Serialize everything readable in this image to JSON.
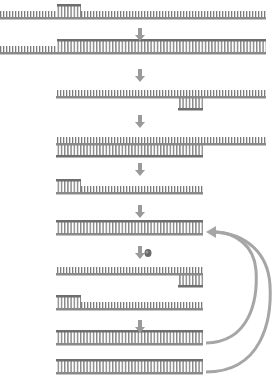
{
  "diagram": {
    "type": "dna-amplification-process",
    "colors": {
      "backbone": "#8a8a8a",
      "backbone_dark": "#6e6e6e",
      "rungs": "#7a7a7a",
      "arrow": "#9a9a9a",
      "enzyme": "#6a6a6a",
      "background": "#ffffff"
    },
    "rows": [
      {
        "id": 1,
        "y": 17,
        "x1": 0,
        "x2": 266,
        "double": [
          [
            57,
            81
          ]
        ],
        "top_strand": [
          [
            57,
            81
          ]
        ]
      },
      {
        "id": 2,
        "y": 52,
        "x1": 0,
        "x2": 266,
        "double": [
          [
            57,
            266
          ]
        ],
        "top_strand": [
          [
            57,
            266
          ]
        ]
      },
      {
        "id": 3,
        "y": 96,
        "x1": 56,
        "x2": 266,
        "double": [
          [
            178,
            203
          ]
        ],
        "bottom_strand": [
          [
            178,
            203
          ]
        ]
      },
      {
        "id": 4,
        "y": 143,
        "x1": 56,
        "x2": 266,
        "double": [
          [
            56,
            203
          ]
        ],
        "bottom_strand": [
          [
            56,
            203
          ]
        ]
      },
      {
        "id": 5,
        "y": 192,
        "x1": 56,
        "x2": 203,
        "double": [
          [
            56,
            81
          ]
        ],
        "top_strand": [
          [
            56,
            81
          ]
        ]
      },
      {
        "id": 6,
        "y": 233,
        "x1": 56,
        "x2": 203,
        "double": [
          [
            56,
            203
          ]
        ]
      },
      {
        "id": 7,
        "y": 273,
        "x1": 56,
        "x2": 203,
        "double": [
          [
            178,
            203
          ]
        ],
        "bottom_strand": [
          [
            178,
            203
          ]
        ]
      },
      {
        "id": 8,
        "y": 308,
        "x1": 56,
        "x2": 203,
        "double": [
          [
            56,
            81
          ]
        ],
        "top_strand": [
          [
            56,
            81
          ]
        ]
      },
      {
        "id": 9,
        "y": 343,
        "x1": 56,
        "x2": 203,
        "double": [
          [
            56,
            203
          ]
        ]
      },
      {
        "id": 10,
        "y": 372,
        "x1": 56,
        "x2": 203,
        "double": [
          [
            56,
            203
          ]
        ]
      }
    ],
    "down_arrows": [
      {
        "x": 140,
        "y": 28
      },
      {
        "x": 140,
        "y": 69
      },
      {
        "x": 140,
        "y": 115
      },
      {
        "x": 140,
        "y": 163
      },
      {
        "x": 140,
        "y": 205
      },
      {
        "x": 140,
        "y": 246
      },
      {
        "x": 140,
        "y": 320
      }
    ],
    "enzyme_marker": {
      "x": 148,
      "y": 253
    },
    "cycle_arrows": [
      {
        "from": "row-9",
        "to": "row-6"
      },
      {
        "from": "row-10",
        "to": "row-6"
      }
    ]
  }
}
